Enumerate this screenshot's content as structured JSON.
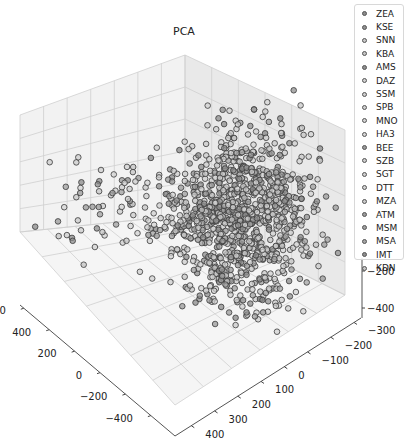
{
  "chart_data": {
    "type": "scatter",
    "projection": "3d",
    "title": "PCA",
    "xlabel": "",
    "ylabel": "",
    "zlabel": "",
    "x_axis": {
      "ticks": [
        600,
        400,
        200,
        0,
        -200,
        -400
      ],
      "range": [
        -450,
        650
      ]
    },
    "y_axis": {
      "ticks": [
        -300,
        -200,
        -100,
        0,
        100,
        200,
        300,
        400
      ],
      "range": [
        -330,
        430
      ]
    },
    "z_axis": {
      "visible_ticks": [
        -200,
        -400
      ],
      "range": [
        -450,
        600
      ]
    },
    "grid": true,
    "legend": {
      "position": "upper right",
      "entries": [
        {
          "label": "ZEA",
          "color": "#8a8a8a"
        },
        {
          "label": "KSE",
          "color": "#909090"
        },
        {
          "label": "SNN",
          "color": "#c8c8c8"
        },
        {
          "label": "KBA",
          "color": "#c4c4c4"
        },
        {
          "label": "AMS",
          "color": "#8e8e8e"
        },
        {
          "label": "DAZ",
          "color": "#d0d0d0"
        },
        {
          "label": "SSM",
          "color": "#cdcdcd"
        },
        {
          "label": "SPB",
          "color": "#cfcfcf"
        },
        {
          "label": "MNO",
          "color": "#d2d2d2"
        },
        {
          "label": "HA3",
          "color": "#d4d4d4"
        },
        {
          "label": "BEE",
          "color": "#999999"
        },
        {
          "label": "SZB",
          "color": "#cccccc"
        },
        {
          "label": "SGT",
          "color": "#cecece"
        },
        {
          "label": "DTT",
          "color": "#d3d3d3"
        },
        {
          "label": "MZA",
          "color": "#c9c9c9"
        },
        {
          "label": "ATM",
          "color": "#9a9a9a"
        },
        {
          "label": "MSM",
          "color": "#a0a0a0"
        },
        {
          "label": "MSA",
          "color": "#a4a4a4"
        },
        {
          "label": "IMT",
          "color": "#8c8c8c"
        },
        {
          "label": "KDN",
          "color": "#c6c6c6"
        }
      ]
    },
    "clusters_screen": [
      {
        "cx": 245,
        "cy": 205,
        "sx": 32,
        "sy": 42,
        "n": 650
      },
      {
        "cx": 205,
        "cy": 215,
        "sx": 30,
        "sy": 30,
        "n": 200
      },
      {
        "cx": 115,
        "cy": 205,
        "sx": 40,
        "sy": 22,
        "n": 70
      },
      {
        "cx": 235,
        "cy": 285,
        "sx": 30,
        "sy": 22,
        "n": 110
      },
      {
        "cx": 285,
        "cy": 215,
        "sx": 18,
        "sy": 40,
        "n": 70
      }
    ]
  }
}
